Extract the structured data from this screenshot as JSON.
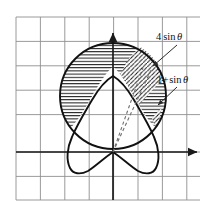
{
  "figure": {
    "background_color": "#ffffff",
    "grid": {
      "color": "#8c8c8c",
      "line_width": 0.9,
      "spacing_px": 24.4,
      "x_start": 16,
      "y_start": 17,
      "columns": 8,
      "rows": 8,
      "visible": true
    },
    "axes": {
      "color": "#1a1a1a",
      "origin": {
        "x": 113,
        "y": 152
      },
      "x_axis": {
        "from_x": 16,
        "to_x": 200,
        "y": 152,
        "arrow": "right"
      },
      "y_axis": {
        "x": 113,
        "from_y": 200,
        "to_y": 30,
        "arrow": "up"
      }
    },
    "labels": [
      {
        "id": "label-four-sin-theta",
        "name": "curve-label-4-sin-theta",
        "text_parts": {
          "coefficient": "4",
          "function": "sin",
          "variable": "θ"
        },
        "full_text": "4 sin θ",
        "x": 156,
        "y": 39,
        "leader": {
          "from_x": 176,
          "from_y": 44,
          "to_x": 152,
          "to_y": 65,
          "arrow": true
        }
      },
      {
        "id": "label-one-plus-sin-theta",
        "name": "curve-label-1-plus-sin-theta",
        "text_parts": {
          "constant": "1",
          "operator": "+",
          "function": "sin",
          "variable": "θ"
        },
        "full_text": "1+sin θ",
        "x": 157,
        "y": 82,
        "leader": {
          "from_x": 176,
          "from_y": 86,
          "to_x": 157,
          "to_y": 104,
          "arrow": true
        }
      }
    ],
    "curves": [
      {
        "id": "circle-4sin",
        "name": "circle-r-equals-4-sin-theta",
        "equation": "r = 4 sin θ",
        "shape": "circle",
        "center": {
          "x": 113,
          "y": 96
        },
        "radius": 53,
        "stroke": "#111111",
        "stroke_width": 1.9
      },
      {
        "id": "cardioid-1plussin",
        "name": "cardioid-r-equals-1-plus-sin-theta",
        "equation": "r = 1 + sin θ",
        "shape": "cardioid",
        "scale_px": 38,
        "cusp": {
          "x": 113,
          "y": 152
        },
        "stroke": "#111111",
        "stroke_width": 1.9
      }
    ],
    "rays": [
      {
        "id": "ray-theta-1",
        "name": "dashed-ray-lower-boundary",
        "from": {
          "x": 113,
          "y": 152
        },
        "to": {
          "x": 152,
          "y": 68
        },
        "style": "dashed",
        "stroke": "#6a6a6a"
      },
      {
        "id": "ray-theta-2",
        "name": "dashed-ray-upper-boundary",
        "from": {
          "x": 113,
          "y": 152
        },
        "to": {
          "x": 143,
          "y": 66
        },
        "style": "dashed",
        "stroke": "#6a6a6a"
      }
    ],
    "shaded_regions": [
      {
        "id": "region-horizontal-hatch",
        "name": "region-between-circle-and-cardioid-horizontal-hatch",
        "hatch_style": "horizontal",
        "hatch_spacing_px": 3.2,
        "hatch_color": "#1a1a1a",
        "description": "Area inside circle r = 4 sin θ and outside cardioid r = 1 + sin θ"
      },
      {
        "id": "region-diagonal-hatch",
        "name": "region-wedge-diagonal-hatch",
        "hatch_style": "diagonal-45",
        "hatch_spacing_px": 3.0,
        "hatch_color": "#1a1a1a",
        "description": "Wedge sector bounded by the two dashed rays"
      }
    ]
  }
}
